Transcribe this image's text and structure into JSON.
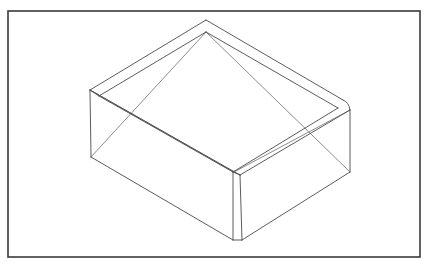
{
  "document": {
    "title": "Isometric Open Box Wireframe",
    "background_color": "#ffffff"
  },
  "frame": {
    "name": "drawing-border",
    "x": 8,
    "y": 11,
    "width": 412,
    "height": 246,
    "stroke_color": "#3a3a3a",
    "stroke_width": 1.6
  },
  "figure": {
    "name": "open-top-box",
    "stroke_color": "#4a4a4a",
    "hidden_stroke_color": "#6e6e6e",
    "stroke_width": 0.9
  },
  "geometry": {
    "vertices": {
      "outer_top_back": [
        206,
        20
      ],
      "outer_top_left": [
        90,
        90
      ],
      "outer_top_right_a": [
        343,
        100
      ],
      "outer_top_right_b": [
        350,
        110
      ],
      "outer_top_front": [
        240,
        175
      ],
      "outer_bottom_left": [
        91,
        157
      ],
      "outer_bottom_right": [
        350,
        172
      ],
      "outer_bottom_front": [
        242,
        240
      ],
      "inner_top_back": [
        206,
        32
      ],
      "inner_top_left": [
        99,
        96
      ],
      "inner_top_right": [
        338,
        108
      ],
      "inner_top_front": [
        233,
        172
      ],
      "inner_bottom_front": [
        233,
        240
      ],
      "cross_left": [
        148,
        122
      ],
      "cross_right": [
        292,
        134
      ]
    },
    "paths": {
      "outer_rim_top": "M 90,90 L 206,20 L 343,100 L 350,110 L 240,175 L 91,157 Z",
      "inner_rim_top": "M 99,96 L 206,32 L 338,108 L 233,172 Z",
      "wall_left_outer": "M 90,90 L 91,157",
      "wall_right_outer": "M 350,110 L 350,172",
      "wall_front_outer": "M 240,175 L 242,240",
      "wall_front_inner": "M 233,172 L 233,240",
      "base_front_left": "M 91,157 L 233,240",
      "base_front_right": "M 242,240 L 350,172",
      "hidden_diag_left": "M 90,90 L 233,172",
      "hidden_diag_right": "M 350,110 L 233,172",
      "hidden_base_left": "M 91,157 L 206,32",
      "hidden_base_right": "M 350,172 L 206,32"
    }
  }
}
